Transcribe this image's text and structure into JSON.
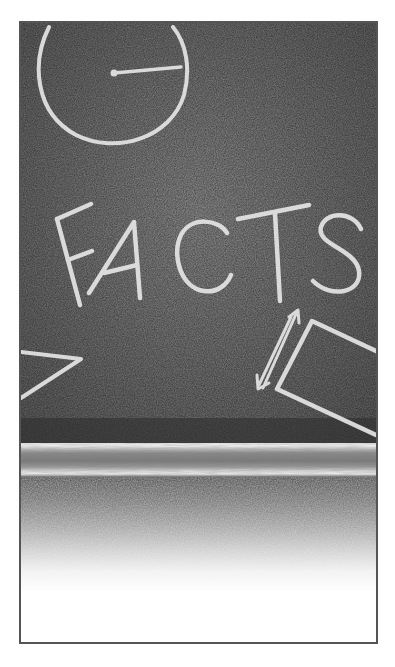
{
  "illustration": {
    "subject": "chalkboard",
    "chalk_text": "FACTS",
    "drawings": [
      "clock-circle",
      "triangle",
      "rectangle",
      "double-arrow"
    ],
    "colors": {
      "board": "#4a4a4a",
      "chalk": "#e6e6e6",
      "frame_border": "#555555",
      "background": "#ffffff"
    }
  }
}
